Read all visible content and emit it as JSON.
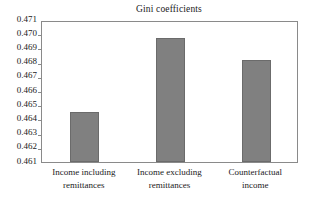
{
  "chart_data": {
    "type": "bar",
    "title": "Gini coefficients",
    "xlabel": "",
    "ylabel": "",
    "categories": [
      "Income including remittances",
      "Income excluding remittances",
      "Counterfactual income"
    ],
    "values": [
      0.4645,
      0.4697,
      0.4682
    ],
    "ylim": [
      0.461,
      0.471
    ],
    "yticks": [
      "0.471",
      "0.470",
      "0.469",
      "0.468",
      "0.467",
      "0.466",
      "0.465",
      "0.464",
      "0.463",
      "0.462",
      "0.461"
    ],
    "ytick_values": [
      0.471,
      0.47,
      0.469,
      0.468,
      0.467,
      0.466,
      0.465,
      0.464,
      0.463,
      0.462,
      0.461
    ],
    "grid": false,
    "legend": false,
    "series": [
      {
        "name": "Gini coefficient",
        "values": [
          0.4645,
          0.4697,
          0.4682
        ],
        "color": "#808080"
      }
    ],
    "bar_color": "#808080",
    "bar_edge_color": "#6b6b6b",
    "axis_color": "#8a8a8a",
    "background_color": "#ffffff",
    "text_color": "#1a1a1a",
    "category_lines": [
      [
        "Income including",
        "remittances"
      ],
      [
        "Income excluding",
        "remittances"
      ],
      [
        "Counterfactual",
        "income"
      ]
    ]
  }
}
